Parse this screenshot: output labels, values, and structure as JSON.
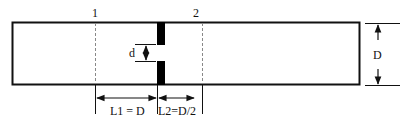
{
  "diagram": {
    "section_labels": [
      "1",
      "2"
    ],
    "orifice_label": "d",
    "pipe_diameter_label": "D",
    "dimension_labels": {
      "upstream": "L1 = D",
      "downstream": "L2=D/2"
    },
    "colors": {
      "stroke": "#111111",
      "fill": "#000000",
      "dashed": "#888888",
      "background": "#ffffff"
    }
  }
}
